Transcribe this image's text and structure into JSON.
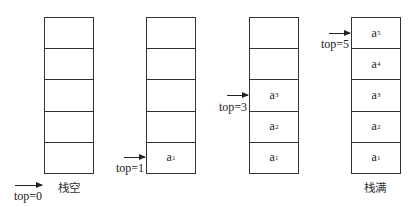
{
  "diagram": {
    "type": "sequential-stack-states",
    "stacks": [
      {
        "id": "empty",
        "caption": "栈空",
        "pointer": "top=0",
        "cells": [
          "",
          "",
          "",
          "",
          ""
        ]
      },
      {
        "id": "one",
        "caption": "",
        "pointer": "top=1",
        "cells": [
          "a1",
          "",
          "",
          "",
          ""
        ]
      },
      {
        "id": "three",
        "caption": "",
        "pointer": "top=3",
        "cells": [
          "a1",
          "a2",
          "a3",
          "",
          ""
        ]
      },
      {
        "id": "full",
        "caption": "栈满",
        "pointer": "top=5",
        "cells": [
          "a1",
          "a2",
          "a3",
          "a4",
          "a5"
        ]
      }
    ]
  }
}
